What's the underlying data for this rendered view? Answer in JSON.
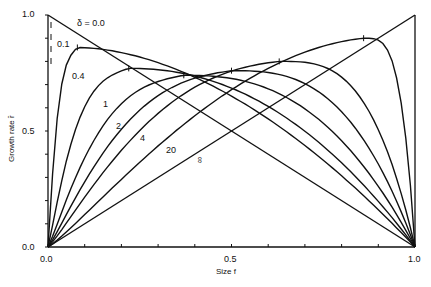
{
  "chart_data": {
    "type": "line",
    "title": "",
    "xlabel": "Size f",
    "ylabel": "Growth rate r̂",
    "xlim": [
      0.0,
      1.0
    ],
    "ylim": [
      0.0,
      1.0
    ],
    "x_ticks": [
      "0.0",
      "0.5",
      "1.0"
    ],
    "y_ticks": [
      "0.0",
      "0.5",
      "1.0"
    ],
    "legend": "inline curve labels",
    "series": [
      {
        "name": "δ = 0.0",
        "label": "δ = 0.0",
        "peak_f": 0.0,
        "peak_r": 1.0
      },
      {
        "name": "0.1",
        "label": "0.1",
        "peak_f": 0.08,
        "peak_r": 0.86
      },
      {
        "name": "0.4",
        "label": "0.4",
        "peak_f": 0.22,
        "peak_r": 0.77
      },
      {
        "name": "1",
        "label": "1",
        "peak_f": 0.37,
        "peak_r": 0.74
      },
      {
        "name": "2",
        "label": "2",
        "peak_f": 0.5,
        "peak_r": 0.76
      },
      {
        "name": "4",
        "label": "4",
        "peak_f": 0.63,
        "peak_r": 0.8
      },
      {
        "name": "20",
        "label": "20",
        "peak_f": 0.86,
        "peak_r": 0.9
      },
      {
        "name": "∞",
        "label": "∞",
        "peak_f": 1.0,
        "peak_r": 1.0
      }
    ]
  },
  "axis": {
    "x_title": "Size f",
    "y_title": "Growth rate r̂",
    "x_ticks": [
      "0.0",
      "0.5",
      "1.0"
    ],
    "y_ticks": [
      "0.0",
      "0.5",
      "1.0"
    ]
  },
  "labels": {
    "d0": "δ = 0.0",
    "d01": "0.1",
    "d04": "0.4",
    "d1": "1",
    "d2": "2",
    "d4": "4",
    "d20": "20",
    "dinf": "∞"
  }
}
